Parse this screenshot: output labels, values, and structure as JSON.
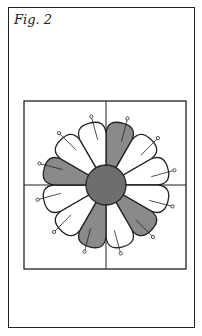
{
  "figure": {
    "caption": "Fig. 2",
    "petal_count": 12,
    "shaded_petals": [
      0,
      4,
      6,
      9
    ],
    "colors": {
      "outline": "#222222",
      "petal_light": "#ffffff",
      "petal_dark": "#8a8a8a",
      "center": "#6e6e6e",
      "background": "#ffffff"
    }
  }
}
